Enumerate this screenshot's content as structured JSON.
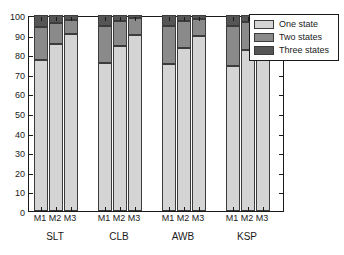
{
  "chart_data": {
    "type": "bar",
    "stacked": true,
    "title": "",
    "xlabel": "",
    "ylabel": "",
    "ylim": [
      0,
      100
    ],
    "yticks": [
      0,
      10,
      20,
      30,
      40,
      50,
      60,
      70,
      80,
      90,
      100
    ],
    "grid": false,
    "legend_position": "upper right",
    "groups": [
      "SLT",
      "CLB",
      "AWB",
      "KSP"
    ],
    "subcategories": [
      "M1",
      "M2",
      "M3"
    ],
    "categories": [
      "SLT M1",
      "SLT M2",
      "SLT M3",
      "CLB M1",
      "CLB M2",
      "CLB M3",
      "AWB M1",
      "AWB M2",
      "AWB M3",
      "KSP M1",
      "KSP M2",
      "KSP M3"
    ],
    "series": [
      {
        "name": "One state",
        "color": "#d4d4d4",
        "values": [
          77,
          85,
          90.5,
          75.5,
          84,
          90,
          75,
          83,
          89.5,
          74,
          82,
          88.5
        ]
      },
      {
        "name": "Two states",
        "color": "#8a8a8a",
        "values": [
          17,
          11,
          7,
          19,
          13,
          8.5,
          19.5,
          14,
          8.5,
          20.5,
          14.5,
          9
        ]
      },
      {
        "name": "Three states",
        "color": "#555555",
        "values": [
          6,
          4,
          2.5,
          5.5,
          3,
          1.5,
          5.5,
          3,
          2,
          5.5,
          3.5,
          2.5
        ]
      }
    ]
  },
  "legend": {
    "items": [
      {
        "label": "One state"
      },
      {
        "label": "Two states"
      },
      {
        "label": "Three states"
      }
    ]
  },
  "axis": {
    "y_tick_labels": [
      "0",
      "10",
      "20",
      "30",
      "40",
      "50",
      "60",
      "70",
      "80",
      "90",
      "100"
    ]
  }
}
